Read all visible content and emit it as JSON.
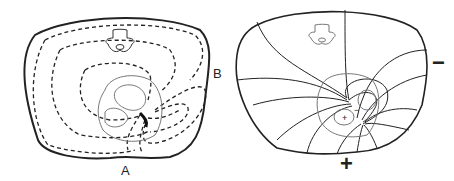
{
  "figure": {
    "panels": [
      {
        "id": "left",
        "description": "Thorax cross-section with dashed current flow lines around heart",
        "labels": {
          "electrode_b": "B",
          "electrode_a": "A"
        }
      },
      {
        "id": "right",
        "description": "Thorax cross-section with solid isopotential lines around heart dipole",
        "labels": {
          "negative_pole": "−",
          "positive_pole": "+",
          "heart_negative": "−",
          "heart_positive": "+"
        }
      }
    ],
    "colors": {
      "line": "#222222",
      "organ": "#777777",
      "background": "#ffffff"
    }
  }
}
